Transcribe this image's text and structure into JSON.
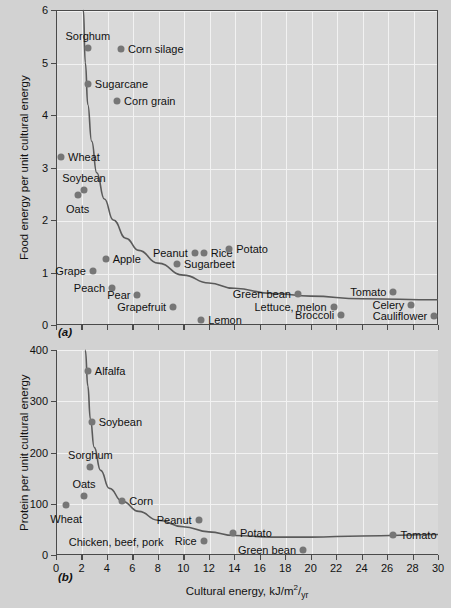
{
  "figure": {
    "background_color": "#d2d2d2",
    "plot_background_color": "#d9d9d9",
    "marker_color": "#767676",
    "gridline_color": "#f2f2f2",
    "axis_color": "#4a4a4a"
  },
  "chart_data": [
    {
      "type": "scatter",
      "panel": "(a)",
      "title": "",
      "xlabel": "",
      "ylabel": "Food energy per unit cultural energy",
      "xlim": [
        0,
        30
      ],
      "ylim": [
        0,
        6
      ],
      "yticks": [
        0,
        1,
        2,
        3,
        4,
        5,
        6
      ],
      "ytick_labels": [
        "0",
        "1",
        "2",
        "3",
        "4",
        "5",
        "6"
      ],
      "xticks": [
        0,
        2,
        4,
        6,
        8,
        10,
        12,
        14,
        16,
        18,
        20,
        22,
        24,
        26,
        28,
        30
      ],
      "xtick_labels": [],
      "grid": true,
      "legend": "none",
      "points": [
        {
          "label": "Sorghum",
          "x": 2.5,
          "y": 5.28,
          "label_pos": "above"
        },
        {
          "label": "Corn silage",
          "x": 5.1,
          "y": 5.25,
          "label_pos": "right"
        },
        {
          "label": "Sugarcane",
          "x": 2.5,
          "y": 4.6,
          "label_pos": "right"
        },
        {
          "label": "Corn grain",
          "x": 4.8,
          "y": 4.27,
          "label_pos": "right"
        },
        {
          "label": "Wheat",
          "x": 0.4,
          "y": 3.2,
          "label_pos": "right"
        },
        {
          "label": "Soybean",
          "x": 2.2,
          "y": 2.57,
          "label_pos": "above"
        },
        {
          "label": "Oats",
          "x": 1.7,
          "y": 2.48,
          "label_pos": "below"
        },
        {
          "label": "Apple",
          "x": 3.9,
          "y": 1.25,
          "label_pos": "right"
        },
        {
          "label": "Peanut",
          "x": 10.9,
          "y": 1.37,
          "label_pos": "left"
        },
        {
          "label": "Rice",
          "x": 11.6,
          "y": 1.37,
          "label_pos": "right"
        },
        {
          "label": "Potato",
          "x": 13.6,
          "y": 1.45,
          "label_pos": "right"
        },
        {
          "label": "Sugarbeet",
          "x": 9.5,
          "y": 1.17,
          "label_pos": "right"
        },
        {
          "label": "Grape",
          "x": 2.9,
          "y": 1.02,
          "label_pos": "left"
        },
        {
          "label": "Peach",
          "x": 4.4,
          "y": 0.71,
          "label_pos": "left"
        },
        {
          "label": "Pear",
          "x": 6.4,
          "y": 0.57,
          "label_pos": "left"
        },
        {
          "label": "Green bean",
          "x": 19.0,
          "y": 0.6,
          "label_pos": "left"
        },
        {
          "label": "Tomato",
          "x": 26.5,
          "y": 0.62,
          "label_pos": "left"
        },
        {
          "label": "Grapefruit",
          "x": 9.2,
          "y": 0.34,
          "label_pos": "left"
        },
        {
          "label": "Lettuce, melon",
          "x": 21.8,
          "y": 0.35,
          "label_pos": "left"
        },
        {
          "label": "Celery",
          "x": 27.9,
          "y": 0.38,
          "label_pos": "left"
        },
        {
          "label": "Lemon",
          "x": 11.4,
          "y": 0.1,
          "label_pos": "right"
        },
        {
          "label": "Broccoli",
          "x": 22.4,
          "y": 0.2,
          "label_pos": "left"
        },
        {
          "label": "Cauliflower",
          "x": 29.7,
          "y": 0.17,
          "label_pos": "left"
        }
      ],
      "curve_note": "hyperbolic decay curve",
      "curve_points": [
        [
          2.15,
          6.0
        ],
        [
          2.3,
          5.0
        ],
        [
          2.5,
          4.2
        ],
        [
          2.8,
          3.5
        ],
        [
          3.2,
          2.9
        ],
        [
          3.8,
          2.4
        ],
        [
          4.5,
          2.0
        ],
        [
          5.5,
          1.65
        ],
        [
          6.5,
          1.42
        ],
        [
          8.0,
          1.18
        ],
        [
          10.0,
          0.95
        ],
        [
          12.0,
          0.8
        ],
        [
          14.0,
          0.7
        ],
        [
          17.0,
          0.6
        ],
        [
          20.0,
          0.55
        ],
        [
          24.0,
          0.5
        ],
        [
          30.0,
          0.48
        ]
      ]
    },
    {
      "type": "scatter",
      "panel": "(b)",
      "title": "",
      "xlabel": "Cultural energy, kJ/m2/yr",
      "ylabel": "Protein per unit cultural energy",
      "xlim": [
        0,
        30
      ],
      "ylim": [
        0,
        400
      ],
      "yticks": [
        0,
        100,
        200,
        300,
        400
      ],
      "ytick_labels": [
        "0",
        "100",
        "200",
        "300",
        "400"
      ],
      "xticks": [
        0,
        2,
        4,
        6,
        8,
        10,
        12,
        14,
        16,
        18,
        20,
        22,
        24,
        26,
        28,
        30
      ],
      "xtick_labels": [
        "0",
        "2",
        "4",
        "6",
        "8",
        "10",
        "12",
        "14",
        "16",
        "18",
        "20",
        "22",
        "24",
        "26",
        "28",
        "30"
      ],
      "grid": true,
      "legend": "none",
      "points": [
        {
          "label": "Alfalfa",
          "x": 2.5,
          "y": 360,
          "label_pos": "right"
        },
        {
          "label": "Soybean",
          "x": 2.8,
          "y": 260,
          "label_pos": "right"
        },
        {
          "label": "Sorghum",
          "x": 2.7,
          "y": 172,
          "label_pos": "above"
        },
        {
          "label": "Oats",
          "x": 2.2,
          "y": 116,
          "label_pos": "above"
        },
        {
          "label": "Wheat",
          "x": 0.8,
          "y": 97,
          "label_pos": "below"
        },
        {
          "label": "Corn",
          "x": 5.2,
          "y": 105,
          "label_pos": "right"
        },
        {
          "label": "Peanut",
          "x": 11.2,
          "y": 68,
          "label_pos": "left"
        },
        {
          "label": "Potato",
          "x": 13.9,
          "y": 43,
          "label_pos": "right"
        },
        {
          "label": "Rice",
          "x": 11.6,
          "y": 28,
          "label_pos": "left"
        },
        {
          "label": "Green bean",
          "x": 19.4,
          "y": 10,
          "label_pos": "left"
        },
        {
          "label": "Tomato",
          "x": 26.5,
          "y": 40,
          "label_pos": "right"
        }
      ],
      "unmarked_labels": [
        {
          "label": "Chicken, beef, pork",
          "x": 1.0,
          "y": 25
        }
      ],
      "curve_note": "hyperbolic decay curve with slight rise at right",
      "curve_points": [
        [
          2.3,
          400
        ],
        [
          2.5,
          330
        ],
        [
          2.7,
          265
        ],
        [
          3.0,
          210
        ],
        [
          3.5,
          165
        ],
        [
          4.2,
          130
        ],
        [
          5.2,
          105
        ],
        [
          6.5,
          85
        ],
        [
          8.0,
          68
        ],
        [
          10.0,
          55
        ],
        [
          12.0,
          45
        ],
        [
          14.0,
          38
        ],
        [
          17.0,
          35
        ],
        [
          20.0,
          35
        ],
        [
          24.0,
          37
        ],
        [
          30.0,
          40
        ]
      ]
    }
  ]
}
